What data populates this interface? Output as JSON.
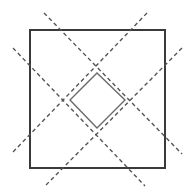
{
  "diagram": {
    "colors": {
      "background": "#ffffff",
      "outer_square": "#3a3a3a",
      "inner_diamond": "#6a6a6a",
      "dashed_lines": "#555555"
    },
    "outer_square": {
      "x": 30,
      "y": 30,
      "width": 135,
      "height": 138
    },
    "inner_diamond": {
      "points": [
        [
          97,
          73
        ],
        [
          125,
          100
        ],
        [
          97,
          128
        ],
        [
          70,
          100
        ]
      ]
    },
    "dashed_lines": [
      {
        "id": "diag-down-1",
        "x1": 44,
        "y1": 13,
        "x2": 182,
        "y2": 154
      },
      {
        "id": "diag-down-2",
        "x1": 13,
        "y1": 48,
        "x2": 145,
        "y2": 186
      },
      {
        "id": "diag-up-1",
        "x1": 147,
        "y1": 13,
        "x2": 13,
        "y2": 152
      },
      {
        "id": "diag-up-2",
        "x1": 182,
        "y1": 48,
        "x2": 45,
        "y2": 186
      }
    ]
  }
}
